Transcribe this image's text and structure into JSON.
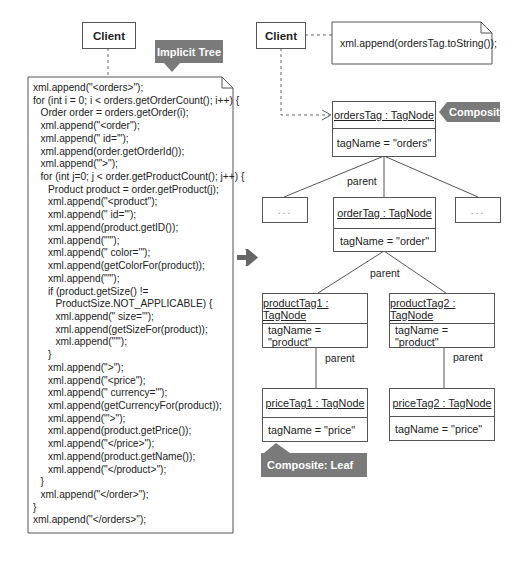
{
  "left": {
    "client_label": "Client",
    "callout": "Implicit Tree",
    "code_lines": [
      {
        "indent": 0,
        "text": "xml.append(\"<orders>\");"
      },
      {
        "indent": 0,
        "text": "for (int i = 0; i < orders.getOrderCount(); i++) {"
      },
      {
        "indent": 1,
        "text": "Order order = orders.getOrder(i);"
      },
      {
        "indent": 1,
        "text": "xml.append(\"<order\");"
      },
      {
        "indent": 1,
        "text": "xml.append(\" id='\");"
      },
      {
        "indent": 1,
        "text": "xml.append(order.getOrderId());"
      },
      {
        "indent": 1,
        "text": "xml.append(\"'>\");"
      },
      {
        "indent": 1,
        "text": "for (int j=0; j < order.getProductCount(); j++) {"
      },
      {
        "indent": 2,
        "text": "Product product = order.getProduct(j);"
      },
      {
        "indent": 2,
        "text": "xml.append(\"<product\");"
      },
      {
        "indent": 2,
        "text": "xml.append(\" id='\");"
      },
      {
        "indent": 2,
        "text": "xml.append(product.getID());"
      },
      {
        "indent": 2,
        "text": "xml.append(\"'\");"
      },
      {
        "indent": 2,
        "text": "xml.append(\" color='\");"
      },
      {
        "indent": 2,
        "text": "xml.append(getColorFor(product));"
      },
      {
        "indent": 2,
        "text": "xml.append(\"'\");"
      },
      {
        "indent": 2,
        "text": "if (product.getSize() !="
      },
      {
        "indent": 3,
        "text": "ProductSize.NOT_APPLICABLE) {"
      },
      {
        "indent": 3,
        "text": "xml.append(\" size='\");"
      },
      {
        "indent": 3,
        "text": "xml.append(getSizeFor(product));"
      },
      {
        "indent": 3,
        "text": "xml.append(\"'\");"
      },
      {
        "indent": 2,
        "text": "}"
      },
      {
        "indent": 2,
        "text": "xml.append(\">\");"
      },
      {
        "indent": 2,
        "text": "xml.append(\"<price\");"
      },
      {
        "indent": 2,
        "text": "xml.append(\" currency='\");"
      },
      {
        "indent": 2,
        "text": "xml.append(getCurrencyFor(product));"
      },
      {
        "indent": 2,
        "text": "xml.append(\"'>\");"
      },
      {
        "indent": 2,
        "text": "xml.append(product.getPrice());"
      },
      {
        "indent": 2,
        "text": "xml.append(\"</price>\");"
      },
      {
        "indent": 2,
        "text": "xml.append(product.getName());"
      },
      {
        "indent": 2,
        "text": "xml.append(\"</product>\");"
      },
      {
        "indent": 1,
        "text": "}"
      },
      {
        "indent": 1,
        "text": "xml.append(\"</order>\");"
      },
      {
        "indent": 0,
        "text": "}"
      },
      {
        "indent": 0,
        "text": "xml.append(\"</orders>\");"
      }
    ]
  },
  "transform_arrow": "→",
  "right": {
    "client_label": "Client",
    "note": "xml.append(ordersTag.toString());",
    "composite_callout": "Composite",
    "leaf_callout": "Composite: Leaf",
    "ellipsis": "...",
    "edge_label": "parent",
    "nodes": {
      "orders": {
        "name": "ordersTag : TagNode",
        "attr": "tagName = \"orders\""
      },
      "order": {
        "name": "orderTag : TagNode",
        "attr": "tagName = \"order\""
      },
      "product1": {
        "name": "productTag1 : TagNode",
        "attr": "tagName = \"product\""
      },
      "product2": {
        "name": "productTag2 : TagNode",
        "attr": "tagName = \"product\""
      },
      "price1": {
        "name": "priceTag1 : TagNode",
        "attr": "tagName = \"price\""
      },
      "price2": {
        "name": "priceTag2 : TagNode",
        "attr": "tagName = \"price\""
      }
    }
  },
  "colors": {
    "callout_bg": "#7a7a7a",
    "line": "#555555",
    "arrow": "#666666"
  }
}
